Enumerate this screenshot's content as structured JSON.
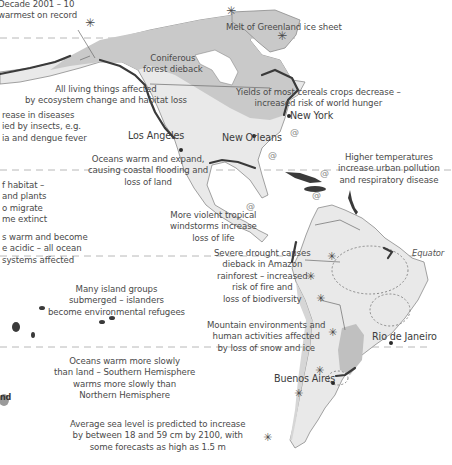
{
  "map": {
    "title": "Projected effects of climate change in the Americas (partial view)",
    "colors": {
      "ocean": "#ffffff",
      "land_light": "#e9e9e9",
      "land_dark": "#c9c9c9",
      "coast_impact": "#3a3a3a",
      "text": "#4a4a4a",
      "dashed_line": "#b5b5b5"
    },
    "legend_panel": {
      "title": "Projec",
      "lines": [
        "These r",
        "moder",
        "averag"
      ]
    },
    "cities": [
      {
        "name": "Los Angeles"
      },
      {
        "name": "New Orleans"
      },
      {
        "name": "New York"
      },
      {
        "name": "Rio de Janeiro"
      },
      {
        "name": "Buenos Aires"
      }
    ],
    "reference_lines": {
      "equator_label": "Equator"
    },
    "annotations": {
      "decade": [
        "Decade 2001 – 10",
        "warmest on record"
      ],
      "greenland": [
        "Melt of Greenland ice sheet"
      ],
      "coniferous": [
        "Coniferous",
        "forest dieback"
      ],
      "living_things": [
        "All living things affected",
        "by ecosystem change and habitat loss"
      ],
      "crops": [
        "Yields of most cereals crops decrease –",
        "increased risk of world hunger"
      ],
      "diseases": [
        "rease in diseases",
        "ied by insects, e.g.",
        "ia and dengue fever"
      ],
      "oceans_expand": [
        "Oceans warm and expand,",
        "causing coastal flooding and",
        "loss of land"
      ],
      "higher_temps": [
        "Higher temperatures",
        "increase urban pollution",
        "and respiratory disease"
      ],
      "habitat": [
        "f habitat –",
        "and plants",
        "o migrate",
        "me extinct"
      ],
      "windstorms": [
        "More violent tropical",
        "windstorms increase",
        "loss of life"
      ],
      "acidic": [
        "s warm and become",
        "e acidic – all ocean",
        "systems affected"
      ],
      "drought": [
        "Severe drought causes",
        "dieback in Amazon",
        "rainforest – increased",
        "risk of fire and",
        "loss of biodiversity"
      ],
      "islands": [
        "Many island groups",
        "submerged – islanders",
        "become environmental refugees"
      ],
      "mountain": [
        "Mountain environments and",
        "human activities affected",
        "by loss of snow and ice"
      ],
      "southern": [
        "Oceans warm more slowly",
        "than land – Southern Hemisphere",
        "warms more slowly than",
        "Northern Hemisphere"
      ],
      "sea_level": [
        "Average sea level is predicted to increase",
        "by between 18 and 59 cm by 2100, with",
        "some forecasts as high as 1.5 m"
      ],
      "new_zealand_fragment": [
        "nd"
      ]
    },
    "markers": {
      "asterisk_symbol": "✳",
      "hurricane_symbol": "@"
    }
  }
}
